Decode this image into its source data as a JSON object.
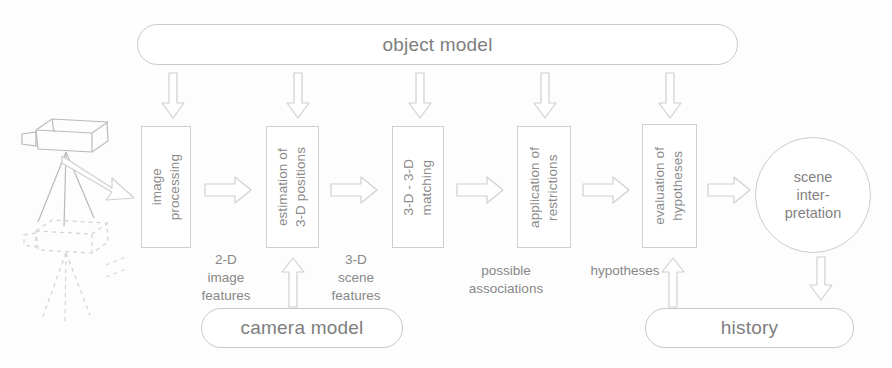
{
  "diagram": {
    "title_box": {
      "label": "object model"
    },
    "process_boxes": [
      {
        "name": "image-processing",
        "label": "image\nprocessing"
      },
      {
        "name": "estimation-3d",
        "label": "estimation of\n3-D positions"
      },
      {
        "name": "matching-3d",
        "label": "3-D - 3-D\nmatching"
      },
      {
        "name": "application-restrictions",
        "label": "application of\nrestrictions"
      },
      {
        "name": "evaluation-hypotheses",
        "label": "evaluation of\nhypotheses"
      }
    ],
    "flow_labels": [
      {
        "name": "2d-image-features",
        "label": "2-D\nimage\nfeatures"
      },
      {
        "name": "3d-scene-features",
        "label": "3-D\nscene\nfeatures"
      },
      {
        "name": "possible-associations",
        "label": "possible\nassociations"
      },
      {
        "name": "hypotheses",
        "label": "hypotheses"
      }
    ],
    "result_circle": {
      "label": "scene\ninter-\npretation"
    },
    "support_boxes": [
      {
        "name": "camera-model",
        "label": "camera model"
      },
      {
        "name": "history",
        "label": "history"
      }
    ],
    "icons": {
      "camera": "camera-on-tripod-icon",
      "camera_ghost": "camera-on-tripod-ghost-icon"
    },
    "colors": {
      "stroke": "#cccccc",
      "text": "#888888",
      "arrow": "#d0d0d0",
      "background": "#fdfdfd"
    }
  }
}
